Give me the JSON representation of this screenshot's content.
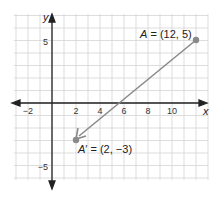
{
  "chart_data": {
    "type": "scatter",
    "title": "",
    "xlabel": "x",
    "ylabel": "y",
    "xlim": [
      -3,
      13
    ],
    "ylim": [
      -6,
      7
    ],
    "grid": true,
    "x_ticks": [
      "-2",
      "2",
      "4",
      "6",
      "8",
      "10"
    ],
    "y_ticks": [
      "5",
      "-5"
    ],
    "points": [
      {
        "name": "A",
        "x": 12,
        "y": 5,
        "label": "A = (12, 5)"
      },
      {
        "name": "A'",
        "x": 2,
        "y": -3,
        "label": "A' = (2, -3)"
      }
    ],
    "annotations": [
      {
        "type": "arrow",
        "from": [
          12,
          5
        ],
        "to": [
          2,
          -3
        ]
      }
    ]
  },
  "axes": {
    "x_label": "x",
    "y_label": "y",
    "x_ticks": [
      {
        "v": -2,
        "t": "−2"
      },
      {
        "v": 2,
        "t": "2"
      },
      {
        "v": 4,
        "t": "4"
      },
      {
        "v": 6,
        "t": "6"
      },
      {
        "v": 8,
        "t": "8"
      },
      {
        "v": 10,
        "t": "10"
      }
    ],
    "y_ticks": [
      {
        "v": 5,
        "t": "5"
      },
      {
        "v": -5,
        "t": "−5"
      }
    ]
  },
  "points": {
    "a_name": "A",
    "a_rest": " = (12, 5)",
    "a2_name": "A",
    "a2_prime": "′",
    "a2_rest": " = (2, −3)"
  },
  "colors": {
    "grid": "#d4d4d4",
    "axis": "#222222",
    "arrow": "#8a8a8a",
    "point": "#8a8a8a"
  }
}
